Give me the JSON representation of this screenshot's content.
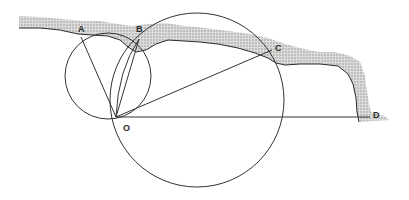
{
  "diagram": {
    "type": "geometry-over-coastline",
    "colors": {
      "line": "#333333",
      "coast_fill": "#bdbdbd",
      "coast_edge": "#2b2b2b",
      "background": "#ffffff"
    },
    "points": {
      "A": {
        "label": "A",
        "x": 81,
        "y": 37,
        "lx": 78,
        "ly": 32
      },
      "B": {
        "label": "B",
        "x": 139,
        "y": 39,
        "lx": 136,
        "ly": 32
      },
      "C": {
        "label": "C",
        "x": 272,
        "y": 50,
        "lx": 275,
        "ly": 51
      },
      "O": {
        "label": "O",
        "x": 116,
        "y": 117,
        "lx": 123,
        "ly": 131
      },
      "D": {
        "label": "D",
        "x": 370,
        "y": 117,
        "lx": 373,
        "ly": 118
      }
    },
    "segments": [
      {
        "from": "O",
        "to": "A"
      },
      {
        "from": "O",
        "to": "B"
      },
      {
        "from": "O",
        "to": "C"
      },
      {
        "from": "O",
        "to": "D"
      }
    ],
    "circles": [
      {
        "name": "small-circle-AOB",
        "cx": 108,
        "cy": 76,
        "r": 43
      },
      {
        "name": "large-circle-BOC",
        "cx": 197,
        "cy": 100,
        "r": 87
      }
    ]
  }
}
